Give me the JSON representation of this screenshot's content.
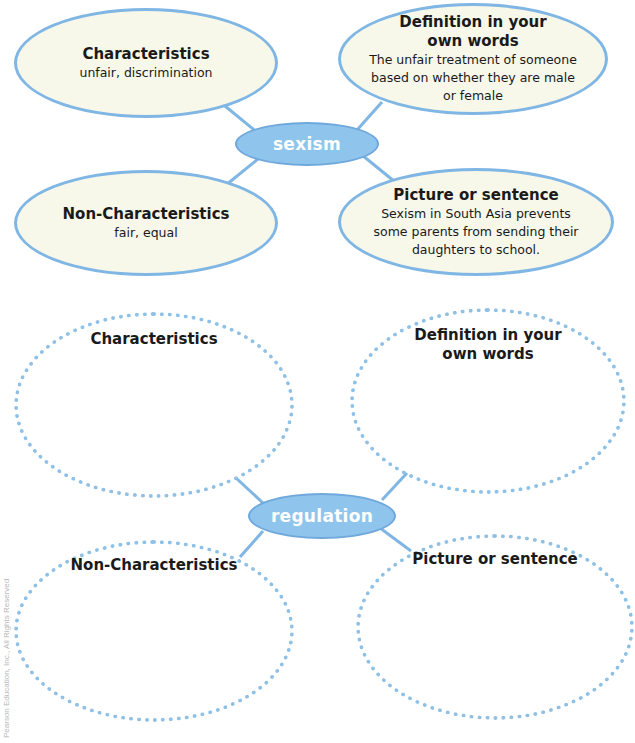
{
  "example_map": {
    "center": "sexism",
    "characteristics": {
      "title": "Characteristics",
      "text": "unfair, discrimination"
    },
    "definition": {
      "title_line1": "Definition in your",
      "title_line2": "own words",
      "text_line1": "The unfair treatment of someone",
      "text_line2": "based on whether they are male",
      "text_line3": "or female"
    },
    "non_characteristics": {
      "title": "Non-Characteristics",
      "text": "fair, equal"
    },
    "picture_or_sentence": {
      "title": "Picture or sentence",
      "text_line1": "Sexism in South Asia prevents",
      "text_line2": "some parents from sending their",
      "text_line3": "daughters to school."
    }
  },
  "blank_map": {
    "center": "regulation",
    "characteristics": {
      "title": "Characteristics"
    },
    "definition": {
      "title_line1": "Definition in your",
      "title_line2": "own words"
    },
    "non_characteristics": {
      "title": "Non-Characteristics"
    },
    "picture_or_sentence": {
      "title": "Picture or sentence"
    }
  },
  "credit": "Pearson Education, Inc., All Rights Reserved",
  "colors": {
    "hub_fill": "#8fc4ec",
    "outline": "#7fb6e4",
    "bubble_fill": "#f7f7ea",
    "text": "#1a1a1a"
  }
}
